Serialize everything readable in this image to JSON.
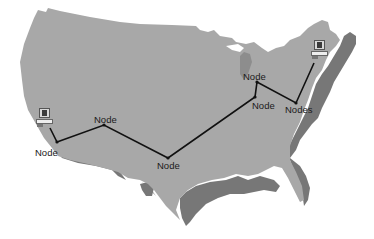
{
  "diagram": {
    "type": "network-map",
    "background_region": "Contiguous United States",
    "colors": {
      "land": "#a8a8a8",
      "coastal_lowland": "#777777",
      "link": "#111111",
      "node_dot": "#111111",
      "background": "#ffffff"
    },
    "nodes": [
      {
        "id": "n1",
        "label": "Node",
        "x": 57,
        "y": 142,
        "label_x": 35,
        "label_y": 148
      },
      {
        "id": "n2",
        "label": "Node",
        "x": 104,
        "y": 125,
        "label_x": 94,
        "label_y": 115
      },
      {
        "id": "n3",
        "label": "Node",
        "x": 168,
        "y": 158,
        "label_x": 157,
        "label_y": 161
      },
      {
        "id": "n4",
        "label": "Node",
        "x": 255,
        "y": 97,
        "label_x": 252,
        "label_y": 101
      },
      {
        "id": "n5",
        "label": "Node",
        "x": 257,
        "y": 82,
        "label_x": 243,
        "label_y": 72
      },
      {
        "id": "n6",
        "label": "Nodes",
        "x": 296,
        "y": 103,
        "label_x": 285,
        "label_y": 105
      }
    ],
    "computers": [
      {
        "id": "pc-west",
        "x": 36,
        "y": 108
      },
      {
        "id": "pc-east",
        "x": 311,
        "y": 40
      }
    ],
    "links": [
      {
        "from": "pc-west",
        "to": "n1"
      },
      {
        "from": "n1",
        "to": "n2"
      },
      {
        "from": "n2",
        "to": "n3"
      },
      {
        "from": "n3",
        "to": "n4"
      },
      {
        "from": "n4",
        "to": "n5"
      },
      {
        "from": "n5",
        "to": "n6"
      },
      {
        "from": "n6",
        "to": "pc-east"
      }
    ]
  }
}
